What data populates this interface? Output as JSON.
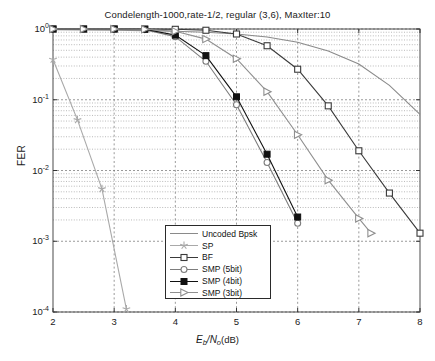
{
  "chart_data": {
    "type": "line",
    "title": "Condelength-1000,rate-1/2, regular (3,6), MaxIter:10",
    "xlabel": "Eb/No(dB)",
    "xlabel_parts": {
      "main": "E",
      "sub1": "b",
      "div": "/N",
      "sub2": "o",
      "unit": "(dB)"
    },
    "ylabel": "FER",
    "xlim": [
      2,
      8
    ],
    "ylim": [
      0.0001,
      1
    ],
    "yscale": "log",
    "xticks": [
      2,
      3,
      4,
      5,
      6,
      7,
      8
    ],
    "xticklabels": [
      "2",
      "3",
      "4",
      "5",
      "6",
      "7",
      "8"
    ],
    "yticks": [
      1,
      0.1,
      0.01,
      0.001,
      0.0001
    ],
    "yticklabels": [
      "10⁰",
      "10⁻¹",
      "10⁻²",
      "10⁻³",
      "10⁻⁴"
    ],
    "ytick_bases": [
      "10",
      "10",
      "10",
      "10",
      "10"
    ],
    "ytick_exps": [
      "0",
      "-1",
      "-2",
      "-3",
      "-4"
    ],
    "grid": true,
    "grid_minor": true,
    "legend_position": "lower center",
    "series": [
      {
        "name": "Uncoded Bpsk",
        "marker": "none",
        "color": "#8a8a8a",
        "x": [
          2,
          2.5,
          3,
          3.5,
          4,
          4.5,
          5,
          5.5,
          6,
          6.5,
          7,
          7.5,
          8
        ],
        "y": [
          0.98,
          0.97,
          0.96,
          0.95,
          0.93,
          0.9,
          0.85,
          0.77,
          0.65,
          0.49,
          0.32,
          0.16,
          0.062
        ]
      },
      {
        "name": "SP",
        "marker": "star",
        "color": "#a9a9a9",
        "x": [
          2,
          2.4,
          2.8,
          3.2
        ],
        "y": [
          0.37,
          0.052,
          0.0055,
          0.00011
        ]
      },
      {
        "name": "BF",
        "marker": "square-open",
        "color": "#3a3a3a",
        "x": [
          2,
          2.5,
          3,
          3.5,
          4,
          4.5,
          5,
          5.5,
          6,
          6.5,
          7,
          7.5,
          8
        ],
        "y": [
          1.0,
          1.0,
          1.0,
          1.0,
          0.99,
          0.96,
          0.85,
          0.58,
          0.27,
          0.082,
          0.019,
          0.0048,
          0.0013
        ]
      },
      {
        "name": "SMP (5bit)",
        "marker": "circle-open",
        "color": "#7d7d7d",
        "x": [
          2,
          2.5,
          3,
          3.5,
          4,
          4.5,
          5,
          5.5,
          6
        ],
        "y": [
          1.0,
          1.0,
          1.0,
          0.98,
          0.78,
          0.35,
          0.085,
          0.013,
          0.0018
        ]
      },
      {
        "name": "SMP (4bit)",
        "marker": "square-filled",
        "color": "#111111",
        "x": [
          2,
          2.5,
          3,
          3.5,
          4,
          4.5,
          5,
          5.5,
          6
        ],
        "y": [
          1.0,
          1.0,
          1.0,
          0.99,
          0.82,
          0.42,
          0.11,
          0.017,
          0.0022
        ]
      },
      {
        "name": "SMP (3bit)",
        "marker": "triangle-right",
        "color": "#8f8f8f",
        "x": [
          2,
          2.5,
          3,
          3.5,
          4,
          4.5,
          5,
          5.5,
          6,
          6.5,
          7,
          7.2
        ],
        "y": [
          1.0,
          1.0,
          1.0,
          0.99,
          0.93,
          0.72,
          0.38,
          0.13,
          0.032,
          0.0073,
          0.0021,
          0.0013
        ]
      }
    ]
  },
  "legend": {
    "items": [
      {
        "label": "Uncoded Bpsk"
      },
      {
        "label": "SP"
      },
      {
        "label": "BF"
      },
      {
        "label": "SMP (5bit)"
      },
      {
        "label": "SMP (4bit)"
      },
      {
        "label": "SMP (3bit)"
      }
    ]
  }
}
